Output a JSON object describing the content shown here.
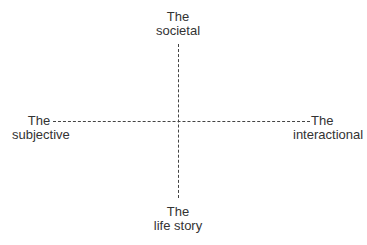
{
  "diagram": {
    "type": "quadrant-axes",
    "top_label": {
      "line1": "The",
      "line2": "societal"
    },
    "bottom_label": {
      "line1": "The",
      "line2": "life story"
    },
    "left_label": {
      "line1": "The",
      "line2": "subjective"
    },
    "right_label": {
      "line1": "The",
      "line2": "interactional"
    },
    "line_color": "#444444",
    "line_style": "dashed"
  }
}
